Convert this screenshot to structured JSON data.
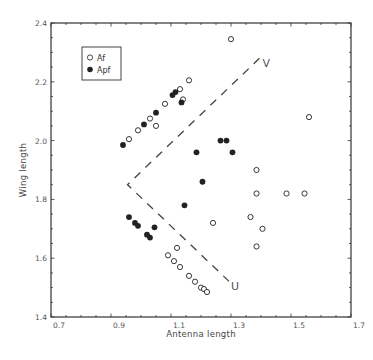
{
  "chart_data": {
    "type": "scatter",
    "title": "",
    "xlabel": "Antenna length",
    "ylabel": "Wing length",
    "xlim": [
      0.7,
      1.7
    ],
    "ylim": [
      1.4,
      2.4
    ],
    "x_ticks": [
      "0.7",
      "0.9",
      "1.1",
      "1.3",
      "1.5",
      "1.7"
    ],
    "y_ticks": [
      "1.4",
      "1.6",
      "1.8",
      "2.0",
      "2.2",
      "2.4"
    ],
    "grid": false,
    "legend_position": "upper-left",
    "series": [
      {
        "name": "Af",
        "marker": "open-circle",
        "points": [
          [
            1.3,
            2.345
          ],
          [
            1.16,
            2.205
          ],
          [
            1.13,
            2.175
          ],
          [
            1.14,
            2.14
          ],
          [
            1.08,
            2.125
          ],
          [
            1.03,
            2.075
          ],
          [
            1.05,
            2.05
          ],
          [
            0.99,
            2.035
          ],
          [
            0.96,
            2.005
          ],
          [
            1.56,
            2.08
          ],
          [
            1.385,
            1.9
          ],
          [
            1.385,
            1.82
          ],
          [
            1.485,
            1.82
          ],
          [
            1.545,
            1.82
          ],
          [
            1.24,
            1.72
          ],
          [
            1.365,
            1.74
          ],
          [
            1.405,
            1.7
          ],
          [
            1.385,
            1.64
          ],
          [
            1.12,
            1.635
          ],
          [
            1.09,
            1.61
          ],
          [
            1.11,
            1.59
          ],
          [
            1.13,
            1.57
          ],
          [
            1.16,
            1.54
          ],
          [
            1.18,
            1.52
          ],
          [
            1.2,
            1.5
          ],
          [
            1.21,
            1.495
          ],
          [
            1.22,
            1.485
          ]
        ]
      },
      {
        "name": "Apf",
        "marker": "filled-circle",
        "points": [
          [
            0.94,
            1.985
          ],
          [
            1.01,
            2.055
          ],
          [
            1.05,
            2.095
          ],
          [
            1.105,
            2.155
          ],
          [
            1.115,
            2.165
          ],
          [
            1.135,
            2.13
          ],
          [
            1.265,
            2.0
          ],
          [
            1.285,
            2.0
          ],
          [
            1.185,
            1.96
          ],
          [
            1.305,
            1.96
          ],
          [
            1.205,
            1.86
          ],
          [
            1.145,
            1.78
          ],
          [
            0.96,
            1.74
          ],
          [
            0.98,
            1.72
          ],
          [
            0.99,
            1.71
          ],
          [
            1.045,
            1.705
          ],
          [
            1.02,
            1.68
          ],
          [
            1.03,
            1.67
          ]
        ]
      }
    ],
    "annotations": [
      {
        "type": "dashed-line",
        "points": [
          [
            1.395,
            2.28
          ],
          [
            0.955,
            1.85
          ],
          [
            1.3,
            1.515
          ]
        ]
      },
      {
        "type": "text",
        "text": "V",
        "x": 1.415,
        "y": 2.265
      },
      {
        "type": "text",
        "text": "U",
        "x": 1.31,
        "y": 1.505
      }
    ]
  },
  "legend": {
    "items": [
      {
        "label": "Af"
      },
      {
        "label": "Apf"
      }
    ]
  },
  "labels": {
    "v": "V",
    "u": "U"
  },
  "colors": {
    "axis": "#333333",
    "marker": "#222222",
    "dash": "#444444"
  }
}
